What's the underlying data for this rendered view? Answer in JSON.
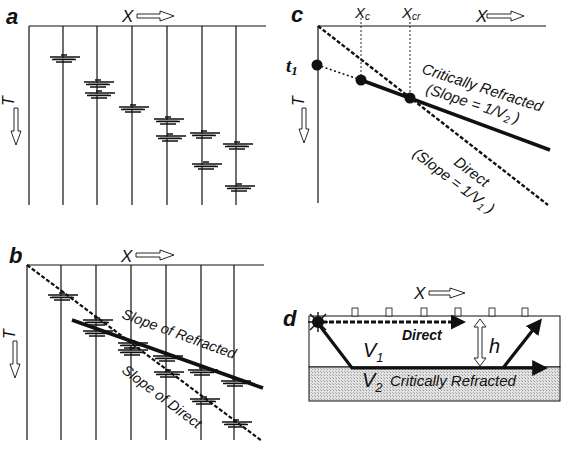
{
  "figure": {
    "panels": [
      {
        "id": "a",
        "label": "a",
        "x_axis": "X",
        "y_axis": "T"
      },
      {
        "id": "b",
        "label": "b",
        "x_axis": "X",
        "y_axis": "T",
        "annotations": [
          "Slope of Refracted",
          "Slope of Direct"
        ]
      },
      {
        "id": "c",
        "label": "c",
        "x_axis": "X",
        "y_axis": "T",
        "markers": {
          "t1": "t",
          "t1_sub": "1",
          "xc": "X",
          "xc_sub": "c",
          "xcr": "X",
          "xcr_sub": "cr"
        },
        "refracted_label_1": "Critically Refracted",
        "refracted_label_2_prefix": "(Slope = 1/V",
        "refracted_label_2_sub": "2",
        "refracted_label_2_suffix": " )",
        "direct_label_1": "Direct",
        "direct_label_2_prefix": "(Slope = 1/V",
        "direct_label_2_sub": "1",
        "direct_label_2_suffix": " )"
      },
      {
        "id": "d",
        "label": "d",
        "x_axis": "X",
        "layer1": "V",
        "layer1_sub": "1",
        "layer2": "V",
        "layer2_sub": "2",
        "direct_label": "Direct",
        "refracted_label": "Critically Refracted",
        "thickness_label": "h"
      }
    ],
    "colors": {
      "ink": "#111111",
      "layer2_fill": "#d4d4d4",
      "background": "#ffffff"
    }
  }
}
